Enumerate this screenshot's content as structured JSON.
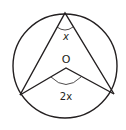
{
  "diagram": {
    "type": "circle-theorem",
    "colors": {
      "stroke": "#231f20",
      "background": "#ffffff"
    },
    "circle": {
      "cx": 65,
      "cy": 66,
      "r": 52
    },
    "points": {
      "top": {
        "x": 65,
        "y": 13
      },
      "left": {
        "x": 20,
        "y": 95
      },
      "right": {
        "x": 114,
        "y": 94
      },
      "centre": {
        "x": 66,
        "y": 68
      }
    },
    "labels": {
      "centre": "O",
      "angle_circumference": "x",
      "angle_centre": "2x"
    }
  }
}
